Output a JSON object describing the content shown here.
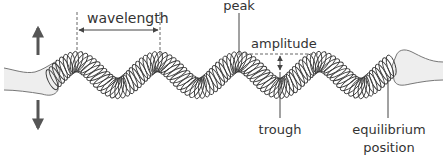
{
  "diagram": {
    "labels": {
      "wavelength": "wavelength",
      "peak": "peak",
      "amplitude": "amplitude",
      "trough": "trough",
      "equilibrium_line1": "equilibrium",
      "equilibrium_line2": "position"
    },
    "motion_arrows": [
      "up",
      "down"
    ],
    "colors": {
      "text": "#333333",
      "spring": "#3a3a3a",
      "arrow": "#555555",
      "hand_fill": "#eeeeee",
      "hand_stroke": "#777777"
    }
  }
}
